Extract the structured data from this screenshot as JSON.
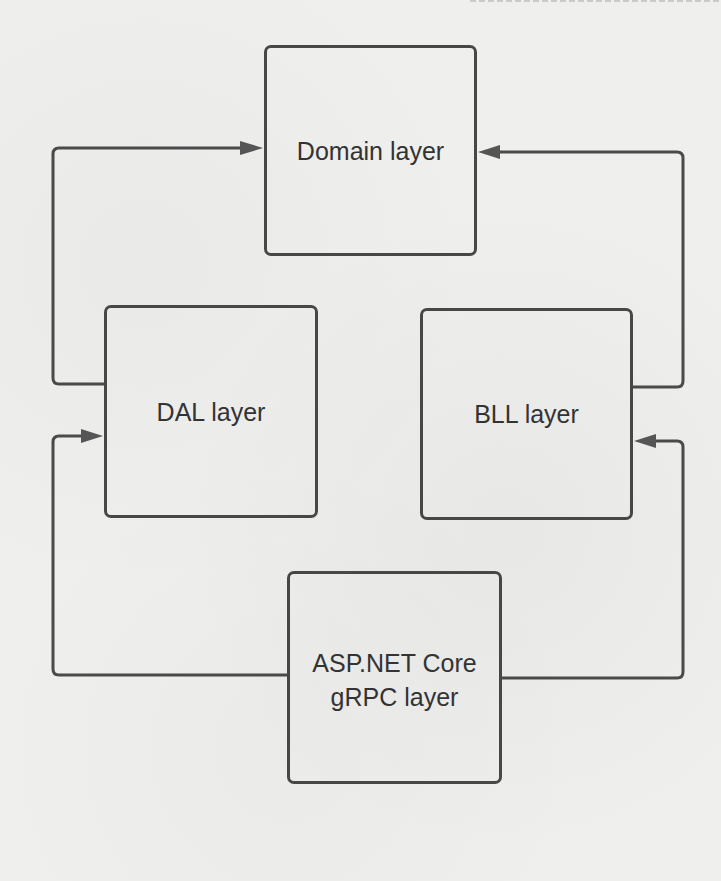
{
  "diagram": {
    "type": "layered-architecture",
    "nodes": [
      {
        "id": "domain",
        "label": "Domain layer"
      },
      {
        "id": "dal",
        "label": "DAL layer"
      },
      {
        "id": "bll",
        "label": "BLL layer"
      },
      {
        "id": "asp",
        "label": "ASP.NET Core\ngRPC layer"
      }
    ],
    "edges": [
      {
        "from": "dal",
        "to": "domain"
      },
      {
        "from": "bll",
        "to": "domain"
      },
      {
        "from": "asp",
        "to": "dal"
      },
      {
        "from": "asp",
        "to": "bll"
      }
    ],
    "colors": {
      "stroke": "#474747",
      "text": "#333333",
      "background": "#efefee"
    }
  }
}
